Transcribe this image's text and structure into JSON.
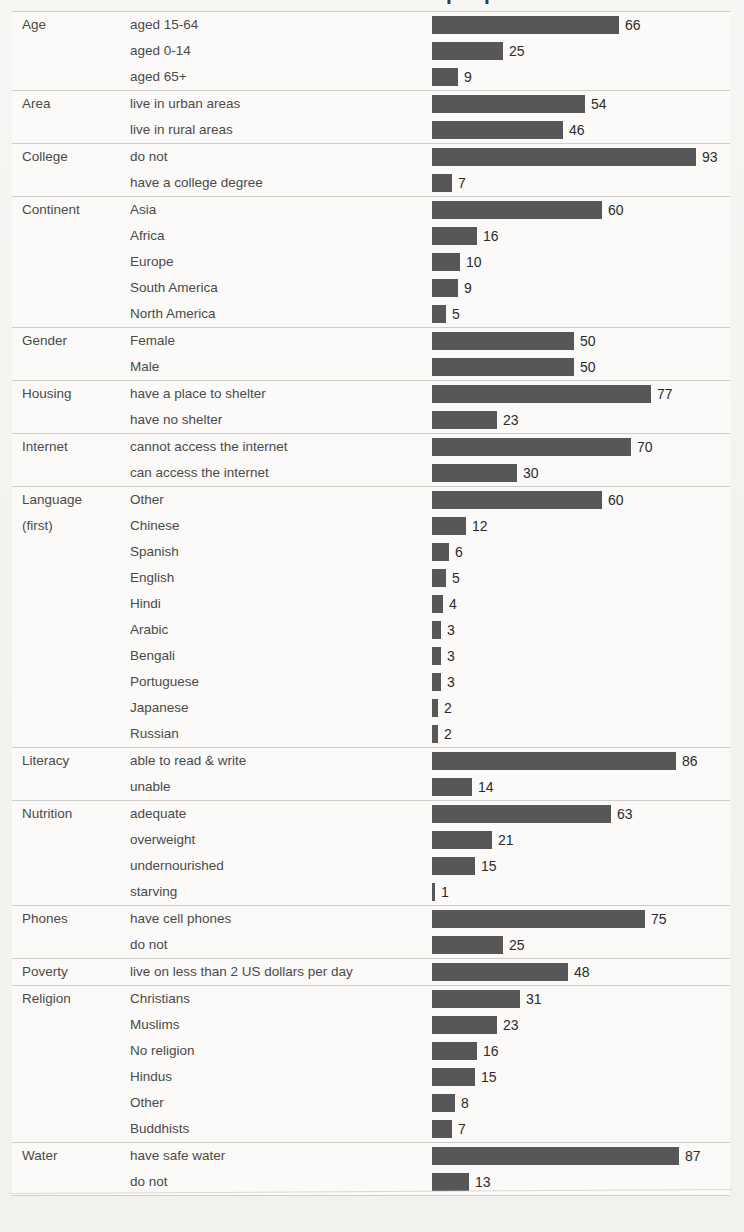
{
  "title": "If the world were 100 people",
  "colors": {
    "bar": "#575757",
    "rule": "#cfcdc9",
    "label_text": "#4a4a4a",
    "value_text": "#2b2b2b",
    "page_background": "#f6f5f3",
    "row_background": "#fbfaf8"
  },
  "chart_data": {
    "type": "bar",
    "title": "If the world were 100 people",
    "xlabel": "",
    "ylabel": "",
    "xlim": [
      0,
      100
    ],
    "grid": false,
    "legend": null,
    "orientation": "horizontal",
    "value_unit": "people per 100",
    "groups": [
      {
        "group": "Age",
        "rows": [
          {
            "label": "aged 15-64",
            "value": 66
          },
          {
            "label": "aged 0-14",
            "value": 25
          },
          {
            "label": "aged 65+",
            "value": 9
          }
        ]
      },
      {
        "group": "Area",
        "rows": [
          {
            "label": "live in urban areas",
            "value": 54
          },
          {
            "label": "live in rural areas",
            "value": 46
          }
        ]
      },
      {
        "group": "College",
        "rows": [
          {
            "label": "do not",
            "value": 93
          },
          {
            "label": "have a college degree",
            "value": 7
          }
        ]
      },
      {
        "group": "Continent",
        "rows": [
          {
            "label": "Asia",
            "value": 60
          },
          {
            "label": "Africa",
            "value": 16
          },
          {
            "label": "Europe",
            "value": 10
          },
          {
            "label": "South America",
            "value": 9
          },
          {
            "label": "North America",
            "value": 5
          }
        ]
      },
      {
        "group": "Gender",
        "rows": [
          {
            "label": "Female",
            "value": 50
          },
          {
            "label": "Male",
            "value": 50
          }
        ]
      },
      {
        "group": "Housing",
        "rows": [
          {
            "label": "have a place to shelter",
            "value": 77
          },
          {
            "label": "have no shelter",
            "value": 23
          }
        ]
      },
      {
        "group": "Internet",
        "rows": [
          {
            "label": "cannot access the internet",
            "value": 70
          },
          {
            "label": "can access the internet",
            "value": 30
          }
        ]
      },
      {
        "group": "Language\n(first)",
        "rows": [
          {
            "label": "Other",
            "value": 60
          },
          {
            "label": "Chinese",
            "value": 12
          },
          {
            "label": "Spanish",
            "value": 6
          },
          {
            "label": "English",
            "value": 5
          },
          {
            "label": "Hindi",
            "value": 4
          },
          {
            "label": "Arabic",
            "value": 3
          },
          {
            "label": "Bengali",
            "value": 3
          },
          {
            "label": "Portuguese",
            "value": 3
          },
          {
            "label": "Japanese",
            "value": 2
          },
          {
            "label": "Russian",
            "value": 2
          }
        ]
      },
      {
        "group": "Literacy",
        "rows": [
          {
            "label": "able to read & write",
            "value": 86
          },
          {
            "label": "unable",
            "value": 14
          }
        ]
      },
      {
        "group": "Nutrition",
        "rows": [
          {
            "label": "adequate",
            "value": 63
          },
          {
            "label": "overweight",
            "value": 21
          },
          {
            "label": "undernourished",
            "value": 15
          },
          {
            "label": "starving",
            "value": 1
          }
        ]
      },
      {
        "group": "Phones",
        "rows": [
          {
            "label": "have cell phones",
            "value": 75
          },
          {
            "label": "do not",
            "value": 25
          }
        ]
      },
      {
        "group": "Poverty",
        "rows": [
          {
            "label": "live on less than 2 US dollars per day",
            "value": 48
          }
        ]
      },
      {
        "group": "Religion",
        "rows": [
          {
            "label": "Christians",
            "value": 31
          },
          {
            "label": "Muslims",
            "value": 23
          },
          {
            "label": "No religion",
            "value": 16
          },
          {
            "label": "Hindus",
            "value": 15
          },
          {
            "label": "Other",
            "value": 8
          },
          {
            "label": "Buddhists",
            "value": 7
          }
        ]
      },
      {
        "group": "Water",
        "rows": [
          {
            "label": "have safe water",
            "value": 87
          },
          {
            "label": "do not",
            "value": 13
          }
        ]
      }
    ]
  }
}
